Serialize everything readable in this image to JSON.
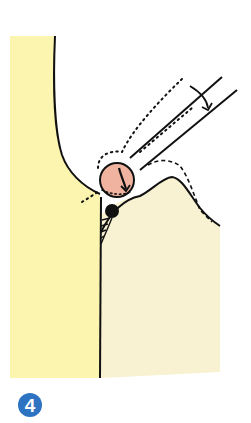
{
  "figure": {
    "colors": {
      "tooth_fill": "#fbf5b0",
      "gum_fill": "#f8f1d2",
      "calculus_circle_fill": "#f0b3a0",
      "deposit_fill": "#111111",
      "outline": "#111111",
      "badge_fill": "#2d73c2",
      "badge_text": "#ffffff"
    },
    "labels": {
      "step_number": "4"
    }
  }
}
